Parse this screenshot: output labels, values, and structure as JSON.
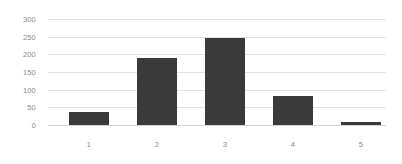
{
  "chart_data": {
    "type": "bar",
    "title": "",
    "subtitle": "",
    "xlabel": "",
    "ylabel": "",
    "categories": [
      "1",
      "2",
      "3",
      "4",
      "5"
    ],
    "values": [
      38,
      190,
      246,
      83,
      8
    ],
    "series": [
      {
        "name": "",
        "values": [
          38,
          190,
          246,
          83,
          8
        ]
      }
    ],
    "ylim": [
      0,
      300
    ],
    "yticks": [
      0,
      50,
      100,
      150,
      200,
      250,
      300
    ],
    "ytick_labels": [
      "0",
      "50",
      "100",
      "150",
      "200",
      "250",
      "300"
    ],
    "grid": true,
    "grid_axis": "y",
    "legend": false,
    "legend_position": "none",
    "annotations": [],
    "colors": {
      "bar": "#3a3a3a",
      "gridline": "#e3e3e3",
      "axis_line": "#d2d2d2",
      "tick_label": "#8a8a8a",
      "background": "#ffffff"
    }
  }
}
